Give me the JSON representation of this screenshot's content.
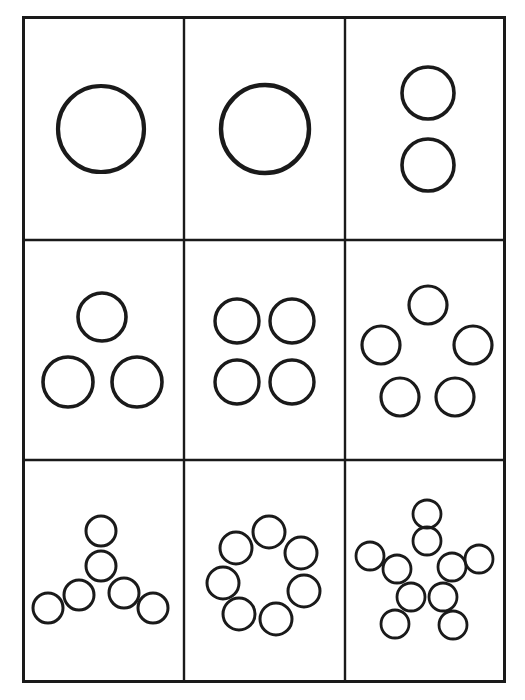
{
  "canvas": {
    "width": 525,
    "height": 700,
    "background": "#ffffff"
  },
  "worksheet": {
    "title": "Circle Count Pattern Grid",
    "ink_color": "#1a1a1a",
    "page_background": "#ffffff",
    "grid": {
      "rows": 3,
      "columns": 3,
      "x": 22,
      "y": 16,
      "width": 484,
      "height": 667,
      "border_width": 3,
      "inner_line_width": 2.4,
      "column_dividers_x": [
        184,
        345
      ],
      "row_dividers_y": [
        240,
        460
      ]
    },
    "cells": [
      {
        "id": "cell-1",
        "name": "one-large-circle",
        "row": 1,
        "column": 1,
        "count": 1,
        "arrangement": "single-center",
        "stroke_width": 4.2,
        "circles": [
          {
            "cx": 101,
            "cy": 129,
            "r": 43
          }
        ]
      },
      {
        "id": "cell-2",
        "name": "one-large-circle-variant",
        "row": 1,
        "column": 2,
        "count": 1,
        "arrangement": "single-center",
        "stroke_width": 4.4,
        "circles": [
          {
            "cx": 265,
            "cy": 129,
            "r": 44
          }
        ]
      },
      {
        "id": "cell-3",
        "name": "two-circles-vertical",
        "row": 1,
        "column": 3,
        "count": 2,
        "arrangement": "vertical-pair",
        "stroke_width": 3.6,
        "circles": [
          {
            "cx": 428,
            "cy": 93,
            "r": 26
          },
          {
            "cx": 428,
            "cy": 165,
            "r": 26
          }
        ]
      },
      {
        "id": "cell-4",
        "name": "three-circles-triangle",
        "row": 2,
        "column": 1,
        "count": 3,
        "arrangement": "triangle",
        "stroke_width": 3.6,
        "circles": [
          {
            "cx": 102,
            "cy": 317,
            "r": 24
          },
          {
            "cx": 68,
            "cy": 382,
            "r": 25
          },
          {
            "cx": 137,
            "cy": 382,
            "r": 25
          }
        ]
      },
      {
        "id": "cell-5",
        "name": "four-circles-square",
        "row": 2,
        "column": 2,
        "count": 4,
        "arrangement": "two-by-two",
        "stroke_width": 3.4,
        "circles": [
          {
            "cx": 237,
            "cy": 321,
            "r": 22
          },
          {
            "cx": 292,
            "cy": 321,
            "r": 22
          },
          {
            "cx": 237,
            "cy": 382,
            "r": 22
          },
          {
            "cx": 292,
            "cy": 382,
            "r": 22
          }
        ]
      },
      {
        "id": "cell-6",
        "name": "five-circles-pentagon",
        "row": 2,
        "column": 3,
        "count": 5,
        "arrangement": "pentagon",
        "stroke_width": 3.2,
        "circles": [
          {
            "cx": 428,
            "cy": 305,
            "r": 19
          },
          {
            "cx": 381,
            "cy": 345,
            "r": 19
          },
          {
            "cx": 473,
            "cy": 345,
            "r": 19
          },
          {
            "cx": 400,
            "cy": 397,
            "r": 19
          },
          {
            "cx": 455,
            "cy": 397,
            "r": 19
          }
        ]
      },
      {
        "id": "cell-7",
        "name": "six-circles-y-shape",
        "row": 3,
        "column": 1,
        "count": 6,
        "arrangement": "y-branch",
        "stroke_width": 3.0,
        "circles": [
          {
            "cx": 101,
            "cy": 531,
            "r": 15
          },
          {
            "cx": 101,
            "cy": 566,
            "r": 15
          },
          {
            "cx": 79,
            "cy": 595,
            "r": 15
          },
          {
            "cx": 48,
            "cy": 608,
            "r": 15
          },
          {
            "cx": 124,
            "cy": 593,
            "r": 15
          },
          {
            "cx": 153,
            "cy": 608,
            "r": 15
          }
        ]
      },
      {
        "id": "cell-8",
        "name": "seven-circles-ring",
        "row": 3,
        "column": 2,
        "count": 7,
        "arrangement": "ring",
        "stroke_width": 3.0,
        "circles": [
          {
            "cx": 269,
            "cy": 532,
            "r": 16
          },
          {
            "cx": 236,
            "cy": 548,
            "r": 16
          },
          {
            "cx": 301,
            "cy": 553,
            "r": 16
          },
          {
            "cx": 223,
            "cy": 583,
            "r": 16
          },
          {
            "cx": 304,
            "cy": 591,
            "r": 16
          },
          {
            "cx": 239,
            "cy": 614,
            "r": 16
          },
          {
            "cx": 276,
            "cy": 619,
            "r": 16
          }
        ]
      },
      {
        "id": "cell-9",
        "name": "ten-circles-star",
        "row": 3,
        "column": 3,
        "count": 10,
        "arrangement": "five-point-star",
        "stroke_width": 2.8,
        "circles": [
          {
            "cx": 427,
            "cy": 514,
            "r": 14
          },
          {
            "cx": 427,
            "cy": 541,
            "r": 14
          },
          {
            "cx": 370,
            "cy": 556,
            "r": 14
          },
          {
            "cx": 397,
            "cy": 569,
            "r": 14
          },
          {
            "cx": 452,
            "cy": 567,
            "r": 14
          },
          {
            "cx": 479,
            "cy": 559,
            "r": 14
          },
          {
            "cx": 411,
            "cy": 597,
            "r": 14
          },
          {
            "cx": 443,
            "cy": 597,
            "r": 14
          },
          {
            "cx": 395,
            "cy": 624,
            "r": 14
          },
          {
            "cx": 453,
            "cy": 625,
            "r": 14
          }
        ]
      }
    ]
  }
}
